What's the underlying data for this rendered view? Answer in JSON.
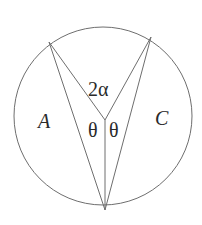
{
  "diagram": {
    "type": "geometry",
    "circle": {
      "cx": 103,
      "cy": 116,
      "r": 89
    },
    "points": {
      "top_left": {
        "x": 49,
        "y": 42
      },
      "top_right": {
        "x": 151,
        "y": 37
      },
      "center": {
        "x": 105,
        "y": 120
      },
      "bottom": {
        "x": 105,
        "y": 210
      }
    },
    "labels": {
      "region_left": "A",
      "region_right": "C",
      "angle_top": "2α",
      "angle_left": "θ",
      "angle_right": "θ"
    },
    "colors": {
      "stroke": "#6e6e6e",
      "text": "#2a2a2a",
      "background": "#ffffff"
    }
  }
}
